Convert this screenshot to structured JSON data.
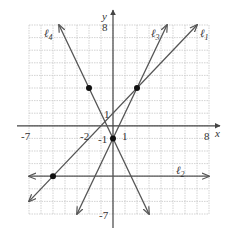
{
  "chart_data": {
    "type": "line",
    "title": "",
    "xlabel": "x",
    "ylabel": "y",
    "xlim": [
      -7,
      8
    ],
    "ylim": [
      -7,
      8
    ],
    "grid": true,
    "x_tick_labels": [
      "-7",
      "-2",
      "1",
      "8"
    ],
    "x_tick_values": [
      -7,
      -2,
      1,
      8
    ],
    "y_tick_labels": [
      "8",
      "1",
      "-1",
      "-7"
    ],
    "y_tick_values": [
      8,
      1,
      -1,
      -7
    ],
    "series": [
      {
        "name": "ℓ1",
        "label_main": "ℓ",
        "label_sub": "1",
        "equation": "y = x + 1",
        "slope": 1,
        "intercept": 1
      },
      {
        "name": "ℓ2",
        "label_main": "ℓ",
        "label_sub": "2",
        "equation": "y = -4",
        "slope": 0,
        "intercept": -4
      },
      {
        "name": "ℓ3",
        "label_main": "ℓ",
        "label_sub": "3",
        "equation": "y = 2x - 1",
        "slope": 2,
        "intercept": -1
      },
      {
        "name": "ℓ4",
        "label_main": "ℓ",
        "label_sub": "4",
        "equation": "y = -2x - 1",
        "slope": -2,
        "intercept": -1
      }
    ],
    "points": [
      {
        "x": 2,
        "y": 3
      },
      {
        "x": -2,
        "y": 3
      },
      {
        "x": 0,
        "y": -1
      },
      {
        "x": -5,
        "y": -4
      }
    ]
  }
}
